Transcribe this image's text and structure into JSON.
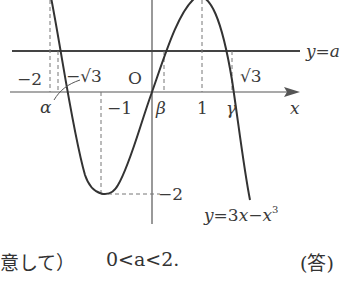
{
  "diagram": {
    "curve_label": "y=3x−x³",
    "curve_label_parts": {
      "lhs": "y",
      "eq": "=3",
      "x1": "x",
      "minus": "−",
      "x2": "x",
      "exp": "3"
    },
    "line_label": "y=a",
    "line_label_parts": {
      "lhs": "y",
      "eq": "=",
      "rhs": "a"
    },
    "x_axis_label": "x",
    "origin_label": "O",
    "tick_labels": {
      "neg2": "−2",
      "neg_sqrt3": "−√3",
      "neg1": "−1",
      "one": "1",
      "sqrt3": "√3",
      "y_neg2": "−2"
    },
    "root_labels": {
      "alpha": "α",
      "beta": "β",
      "gamma": "γ"
    }
  },
  "caption": {
    "left_text": "意して）",
    "answer": "0<a<2.",
    "tag": "(答)"
  }
}
